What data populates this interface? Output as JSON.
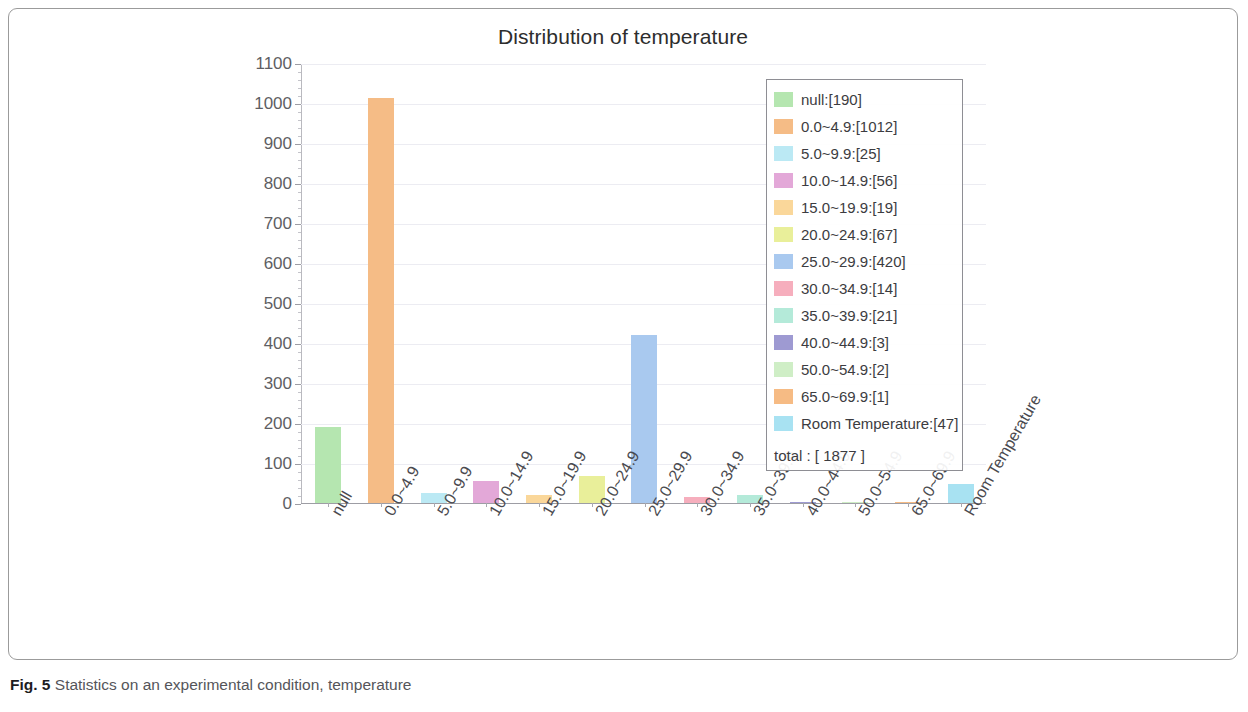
{
  "figure": {
    "caption_label": "Fig. 5",
    "caption_text": "Statistics on an experimental condition, temperature"
  },
  "legend": {
    "total_label": "total : [ 1877 ]",
    "position": "top-right-inside"
  },
  "chart_data": {
    "type": "bar",
    "title": "Distribution of temperature",
    "xlabel": "",
    "ylabel": "",
    "ylim": [
      0,
      1100
    ],
    "ytick_step": 100,
    "grid": true,
    "categories": [
      "null",
      "0.0~4.9",
      "5.0~9.9",
      "10.0~14.9",
      "15.0~19.9",
      "20.0~24.9",
      "25.0~29.9",
      "30.0~34.9",
      "35.0~39.9",
      "40.0~44.9",
      "50.0~54.9",
      "65.0~69.9",
      "Room Temperature"
    ],
    "values": [
      190,
      1012,
      25,
      56,
      19,
      67,
      420,
      14,
      21,
      3,
      2,
      1,
      47
    ],
    "colors": [
      "#b5e6b0",
      "#f5bc86",
      "#bbe9f4",
      "#e3a8d8",
      "#fad79a",
      "#e9ef9a",
      "#a9c9ef",
      "#f6aebd",
      "#b4ead9",
      "#9e9ad2",
      "#cfeec6",
      "#f6bb84",
      "#a8e2f2"
    ],
    "legend_labels": [
      "null:[190]",
      "0.0~4.9:[1012]",
      "5.0~9.9:[25]",
      "10.0~14.9:[56]",
      "15.0~19.9:[19]",
      "20.0~24.9:[67]",
      "25.0~29.9:[420]",
      "30.0~34.9:[14]",
      "35.0~39.9:[21]",
      "40.0~44.9:[3]",
      "50.0~54.9:[2]",
      "65.0~69.9:[1]",
      "Room Temperature:[47]"
    ],
    "ytick_labels": [
      "1100",
      "1000",
      "900",
      "800",
      "700",
      "600",
      "500",
      "400",
      "300",
      "200",
      "100",
      "0"
    ],
    "total": 1877
  }
}
